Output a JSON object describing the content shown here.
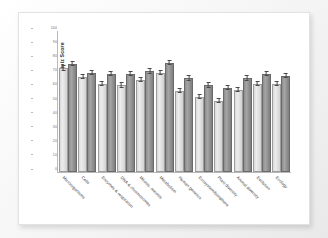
{
  "chart_data": {
    "type": "bar",
    "title": "",
    "xlabel": "",
    "ylabel": "Average Quiz Score",
    "ylim": [
      0,
      100
    ],
    "yticks": [
      0,
      10,
      20,
      30,
      40,
      50,
      60,
      70,
      80,
      90,
      100
    ],
    "grid": false,
    "legend_position": "none",
    "categories": [
      "Microorganisms",
      "Cells",
      "Enzymes & respiration",
      "DNA & chromosomes",
      "Mitosis, meiosis",
      "Metabolism",
      "Human genetics",
      "Ecosystem/biosphere",
      "Plant diversity",
      "Animal diversity",
      "Evolution",
      "Ecology"
    ],
    "series": [
      {
        "name": "Series 1",
        "color": "#e0e0e0",
        "values": [
          72,
          66,
          61,
          60,
          64,
          69,
          56,
          52,
          49,
          57,
          61,
          61
        ],
        "errors": [
          1.5,
          1.5,
          1.5,
          1.5,
          1.5,
          1.5,
          1.5,
          1.5,
          1.5,
          1.5,
          1.5,
          1.5
        ]
      },
      {
        "name": "Series 2",
        "color": "#8e8e8e",
        "values": [
          75,
          69,
          68,
          68,
          70,
          76,
          65,
          60,
          58,
          65,
          68,
          67
        ],
        "errors": [
          1.5,
          1.5,
          1.5,
          1.5,
          1.5,
          1.5,
          1.5,
          1.5,
          1.5,
          1.5,
          1.5,
          1.5
        ]
      }
    ]
  },
  "figure": {
    "background_color": "#ffffff",
    "frame_color": "#e2e2e2",
    "axis_color": "#b9b9b9",
    "tick_text_color": "#6e6e6e"
  }
}
